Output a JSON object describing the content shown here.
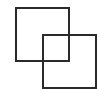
{
  "diagram": {
    "shapes": [
      {
        "type": "square-outline",
        "x": 15,
        "y": 7,
        "width": 55,
        "height": 55,
        "stroke": "#2a2a2a"
      },
      {
        "type": "square-outline",
        "x": 42,
        "y": 34,
        "width": 55,
        "height": 55,
        "stroke": "#2a2a2a"
      }
    ]
  }
}
